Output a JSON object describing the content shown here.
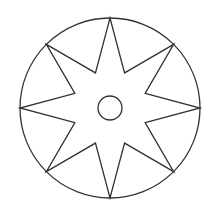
{
  "figure": {
    "width": 217,
    "height": 207,
    "background": "#ffffff",
    "stroke_color": "#333333",
    "stroke_width": 1.3,
    "center": [
      110,
      108
    ],
    "outer_circle": {
      "radius": 90
    },
    "star": {
      "points": 8,
      "outer_radius": 90,
      "inner_radius": 38,
      "rotation_deg": -90
    },
    "inner_circle": {
      "radius": 12
    }
  }
}
